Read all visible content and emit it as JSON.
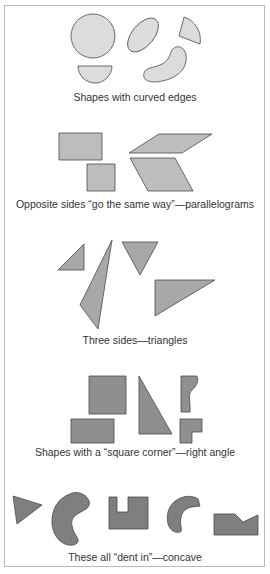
{
  "figure": {
    "sections": [
      {
        "id": "curved",
        "caption": "Shapes with curved edges",
        "shape_count": 5,
        "fill": "#dcdcdc"
      },
      {
        "id": "parallelograms",
        "caption": "Opposite sides “go the same way”—parallelograms",
        "shape_count": 4,
        "fill": "#bdbdbd"
      },
      {
        "id": "triangles",
        "caption": "Three sides—triangles",
        "shape_count": 4,
        "fill": "#a8a8a8"
      },
      {
        "id": "right-angle",
        "caption": "Shapes with a “square corner”—right angle",
        "shape_count": 5,
        "fill": "#8f8f8f"
      },
      {
        "id": "concave",
        "caption": "These all “dent in”—concave",
        "shape_count": 5,
        "fill": "#7f7f7f"
      }
    ],
    "colors": {
      "stroke": "#4a4a4a",
      "border": "#b9b9b9",
      "text": "#333333"
    }
  }
}
